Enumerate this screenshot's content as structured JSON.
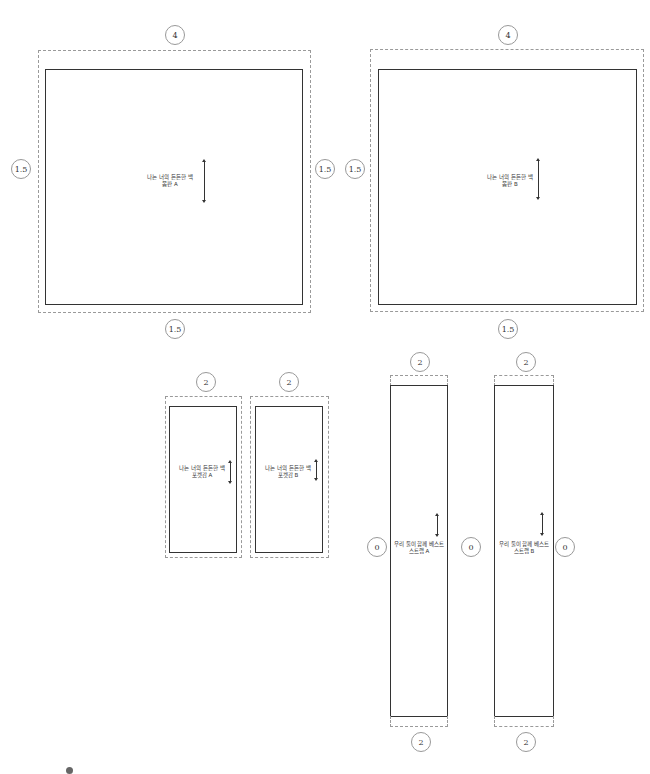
{
  "pieces": {
    "body_a": {
      "label_line1": "나는 너의 든든한 백",
      "label_line2": "몸판 A",
      "seam_top": "4",
      "seam_left": "1.5",
      "seam_right": "1.5",
      "seam_bottom": "1.5"
    },
    "body_b": {
      "label_line1": "나는 너의 든든한 백",
      "label_line2": "몸판 B",
      "seam_top": "4",
      "seam_left": "1.5",
      "seam_bottom": "1.5"
    },
    "pocket_a": {
      "label_line1": "나는 너의 든든한 백",
      "label_line2": "포켓감 A",
      "seam_top": "2"
    },
    "pocket_b": {
      "label_line1": "나는 너의 든든한 백",
      "label_line2": "포켓감 B",
      "seam_top": "2"
    },
    "strap_a": {
      "label_line1": "우리 둘이 함께 베스트",
      "label_line2": "스트랩 A",
      "seam_top": "2",
      "seam_bottom": "2",
      "seam_left": "0"
    },
    "strap_b": {
      "label_line1": "우리 둘이 함께 베스트",
      "label_line2": "스트랩 B",
      "seam_top": "2",
      "seam_bottom": "2",
      "seam_between": "0",
      "seam_right": "0"
    }
  },
  "footnote": "",
  "colors": {
    "cut_line": "#333333",
    "seam_allowance": "#9a9a9a"
  }
}
